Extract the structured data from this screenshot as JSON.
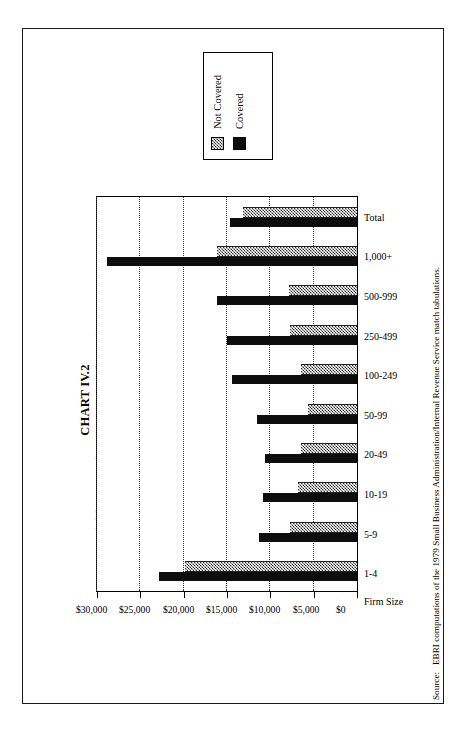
{
  "figure": {
    "title_line1": "CHART IV.2",
    "title_line2": "Depreciable Assets, by Firm Size and Pension Coverage, 1979",
    "source_label": "Source:",
    "source_text": "EBRI computations of the 1979 Small Business Administration/Internal Revenue Service match tabulations."
  },
  "legend": {
    "items": [
      {
        "label": "Not Covered",
        "swatch": "hatched-gray"
      },
      {
        "label": "Covered",
        "swatch": "solid-black"
      }
    ]
  },
  "axes": {
    "category_axis_title": "Firm Size",
    "value_tick_labels": [
      "$0",
      "$5,000",
      "$10,000",
      "$15,000",
      "$20,000",
      "$25,000",
      "$30,000"
    ]
  },
  "chart_data": {
    "type": "bar",
    "title": "Depreciable Assets, by Firm Size and Pension Coverage, 1979",
    "xlabel": "Firm Size",
    "ylabel": "",
    "ylim": [
      0,
      30000
    ],
    "yticks": [
      0,
      5000,
      10000,
      15000,
      20000,
      25000,
      30000
    ],
    "ytick_labels": [
      "$0",
      "$5,000",
      "$10,000",
      "$15,000",
      "$20,000",
      "$25,000",
      "$30,000"
    ],
    "grid": true,
    "legend_position": "above-plot",
    "orientation": "vertical-bars-on-rotated-page",
    "categories": [
      "1-4",
      "5-9",
      "10-19",
      "20-49",
      "50-99",
      "100-249",
      "250-499",
      "500-999",
      "1,000+",
      "Total"
    ],
    "series": [
      {
        "name": "Covered",
        "color": "#0d0d0d",
        "values": [
          22900,
          11300,
          10800,
          10600,
          11500,
          14400,
          15000,
          16200,
          28800,
          14700
        ]
      },
      {
        "name": "Not Covered",
        "color": "#2b2b2b",
        "values": [
          19850,
          7700,
          6800,
          6500,
          5700,
          6500,
          7700,
          7900,
          16100,
          13100
        ]
      }
    ]
  }
}
